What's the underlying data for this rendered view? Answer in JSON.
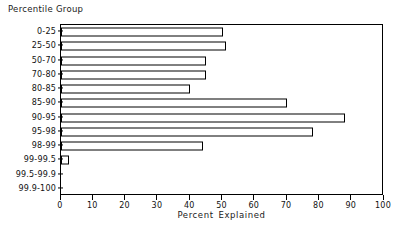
{
  "chart_data": {
    "type": "bar",
    "orientation": "horizontal",
    "title": "",
    "xlabel": "Percent Explained",
    "ylabel": "Percentile Group",
    "xlim": [
      0,
      100
    ],
    "xticks": [
      0,
      10,
      20,
      30,
      40,
      50,
      60,
      70,
      80,
      90,
      100
    ],
    "xtick_labels": [
      "0",
      "10",
      "20",
      "30",
      "40",
      "50",
      "60",
      "70",
      "80",
      "90",
      "100"
    ],
    "grid": false,
    "legend": null,
    "categories": [
      "0-25",
      "25-50",
      "50-70",
      "70-80",
      "80-85",
      "85-90",
      "90-95",
      "95-98",
      "98-99",
      "99-99.5",
      "99.5-99.9",
      "99.9-100"
    ],
    "values": [
      50,
      51,
      45,
      45,
      40,
      70,
      88,
      78,
      44,
      2.5,
      0,
      0
    ],
    "bar_style": {
      "fill": "#ffffff",
      "edge": "#000000"
    }
  }
}
